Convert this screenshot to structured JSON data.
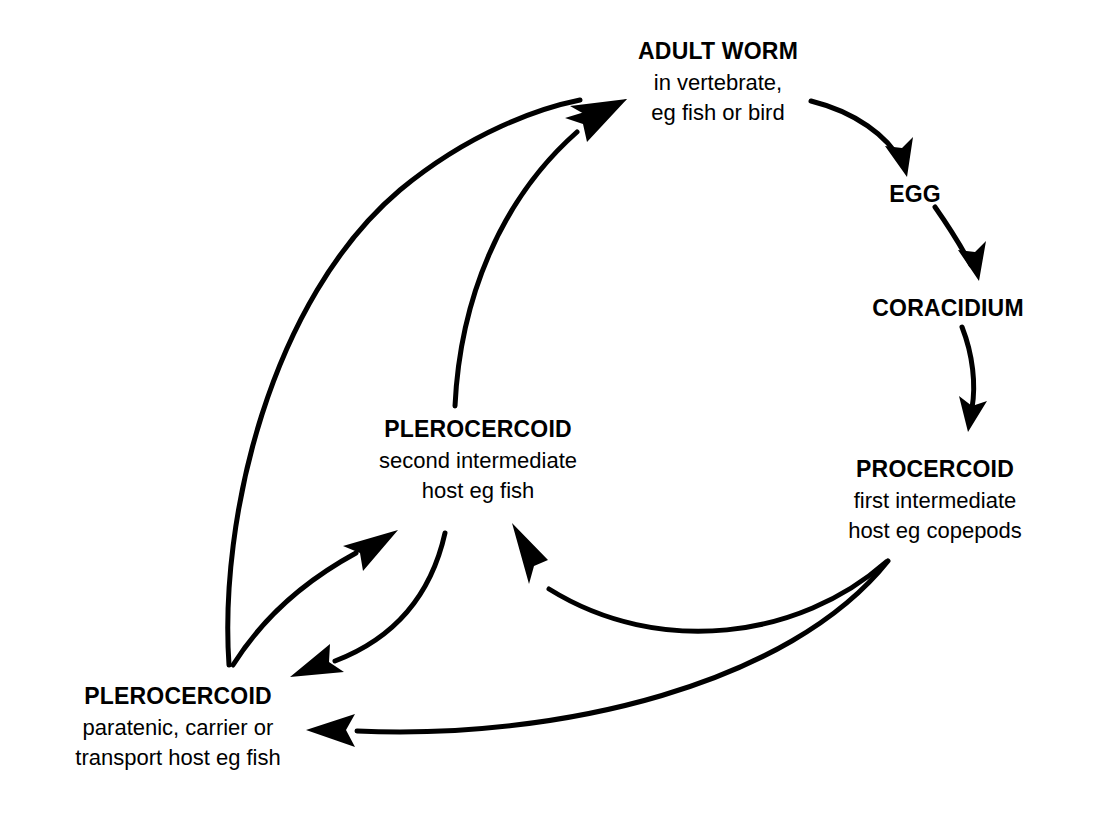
{
  "diagram": {
    "background_color": "#ffffff",
    "line_color": "#000000",
    "line_width": 5,
    "nodes": [
      {
        "id": "adult-worm",
        "title": "ADULT WORM",
        "sub1": "in vertebrate,",
        "sub2": "eg fish or bird",
        "x": 718,
        "y": 40
      },
      {
        "id": "egg",
        "title": "EGG",
        "sub1": "",
        "sub2": "",
        "x": 915,
        "y": 183
      },
      {
        "id": "coracidium",
        "title": "CORACIDIUM",
        "sub1": "",
        "sub2": "",
        "x": 948,
        "y": 297
      },
      {
        "id": "procercoid",
        "title": "PROCERCOID",
        "sub1": "first intermediate",
        "sub2": "host eg copepods",
        "x": 935,
        "y": 458
      },
      {
        "id": "plerocercoid-second",
        "title": "PLEROCERCOID",
        "sub1": "second intermediate",
        "sub2": "host eg fish",
        "x": 478,
        "y": 418
      },
      {
        "id": "plerocercoid-paratenic",
        "title": "PLEROCERCOID",
        "sub1": "paratenic, carrier or",
        "sub2": "transport host eg fish",
        "x": 178,
        "y": 685
      }
    ],
    "arrows": [
      {
        "id": "adult-to-egg",
        "from": "adult-worm",
        "to": "egg",
        "label": "adult worm produces egg"
      },
      {
        "id": "egg-to-coracidium",
        "from": "egg",
        "to": "coracidium",
        "label": "egg hatches to coracidium"
      },
      {
        "id": "coracidium-to-procercoid",
        "from": "coracidium",
        "to": "procercoid",
        "label": "coracidium becomes procercoid"
      },
      {
        "id": "procercoid-to-plerocercoid-second",
        "from": "procercoid",
        "to": "plerocercoid-second",
        "label": "procercoid becomes plerocercoid in second intermediate host"
      },
      {
        "id": "procercoid-to-plerocercoid-paratenic",
        "from": "procercoid",
        "to": "plerocercoid-paratenic",
        "label": "procercoid becomes plerocercoid in paratenic host"
      },
      {
        "id": "plerocercoid-second-to-adult",
        "from": "plerocercoid-second",
        "to": "adult-worm",
        "label": "plerocercoid develops into adult worm"
      },
      {
        "id": "plerocercoid-paratenic-to-adult",
        "from": "plerocercoid-paratenic",
        "to": "adult-worm",
        "label": "paratenic plerocercoid develops into adult worm"
      },
      {
        "id": "plerocercoid-paratenic-to-second",
        "from": "plerocercoid-paratenic",
        "to": "plerocercoid-second",
        "label": "paratenic host to second intermediate host"
      },
      {
        "id": "plerocercoid-second-to-paratenic",
        "from": "plerocercoid-second",
        "to": "plerocercoid-paratenic",
        "label": "second intermediate host to paratenic host"
      }
    ]
  }
}
